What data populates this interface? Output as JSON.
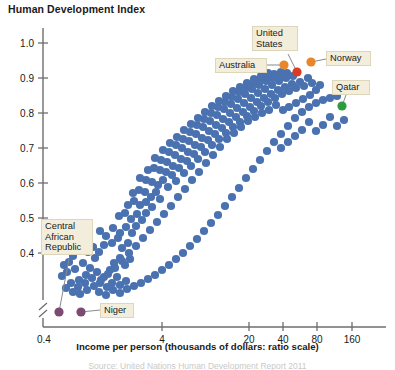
{
  "chart_title": "Human Development Index",
  "x_axis_title": "Income per person (thousands of dollars: ratio scale)",
  "source_note": "Source: United Nations Human Development Report 2011",
  "colors": {
    "point_default": "#4A72B0",
    "point_highlight_orange": "#E8862A",
    "point_highlight_red": "#D93B23",
    "point_highlight_green": "#2E9B40",
    "point_highlight_purple": "#7D4A72",
    "axis": "#6E6E6E",
    "callout_background": "#F3EEDC",
    "callout_border": "#DED6BA",
    "text": "#1A1A1A"
  },
  "chart_data": {
    "type": "scatter",
    "title": "Human Development Index",
    "xlabel": "Income per person (thousands of dollars: ratio scale)",
    "ylabel": "Human Development Index",
    "x_scale": "log",
    "x_scale_note": "ratio scale",
    "grid": false,
    "legend": "none",
    "axis_break_x": true,
    "axis_break_y": true,
    "xlim": [
      0.4,
      220
    ],
    "ylim": [
      0.33,
      1.03
    ],
    "x_ticks": [
      0.4,
      4,
      20,
      40,
      80,
      160
    ],
    "x_tick_labels": [
      "0.4",
      "4",
      "20",
      "40",
      "80",
      "160"
    ],
    "y_ticks": [
      0.4,
      0.5,
      0.6,
      0.7,
      0.8,
      0.9,
      1.0
    ],
    "y_tick_labels": [
      "0.4",
      "0.5",
      "0.6",
      "0.7",
      "0.8",
      "0.9",
      "1.0"
    ],
    "annotations": [
      {
        "label": "Australia",
        "x": 34.0,
        "y": 0.929,
        "color": "#E8862A"
      },
      {
        "label": "United States",
        "x": 43.0,
        "y": 0.91,
        "color": "#D93B23"
      },
      {
        "label": "Norway",
        "x": 57.0,
        "y": 0.943,
        "color": "#E8862A"
      },
      {
        "label": "Qatar",
        "x": 107.0,
        "y": 0.831,
        "color": "#2E9B40"
      },
      {
        "label": "Central African Republic",
        "x": 0.72,
        "y": 0.343,
        "color": "#7D4A72"
      },
      {
        "label": "Niger",
        "x": 1.05,
        "y": 0.343,
        "color": "#7D4A72"
      }
    ],
    "points": [
      {
        "px": 64,
        "py": 265
      },
      {
        "px": 69,
        "py": 262
      },
      {
        "px": 73,
        "py": 256
      },
      {
        "px": 67,
        "py": 272
      },
      {
        "px": 75,
        "py": 269
      },
      {
        "px": 62,
        "py": 276
      },
      {
        "px": 79,
        "py": 280
      },
      {
        "px": 86,
        "py": 275
      },
      {
        "px": 83,
        "py": 263
      },
      {
        "px": 90,
        "py": 268
      },
      {
        "px": 95,
        "py": 258
      },
      {
        "px": 88,
        "py": 252
      },
      {
        "px": 93,
        "py": 247
      },
      {
        "px": 99,
        "py": 252
      },
      {
        "px": 104,
        "py": 245
      },
      {
        "px": 97,
        "py": 272
      },
      {
        "px": 104,
        "py": 277
      },
      {
        "px": 110,
        "py": 270
      },
      {
        "px": 100,
        "py": 283
      },
      {
        "px": 107,
        "py": 287
      },
      {
        "px": 112,
        "py": 283
      },
      {
        "px": 117,
        "py": 277
      },
      {
        "px": 120,
        "py": 285
      },
      {
        "px": 126,
        "py": 281
      },
      {
        "px": 114,
        "py": 263
      },
      {
        "px": 120,
        "py": 258
      },
      {
        "px": 125,
        "py": 265
      },
      {
        "px": 130,
        "py": 259
      },
      {
        "px": 122,
        "py": 248
      },
      {
        "px": 128,
        "py": 243
      },
      {
        "px": 118,
        "py": 238
      },
      {
        "px": 112,
        "py": 243
      },
      {
        "px": 106,
        "py": 236
      },
      {
        "px": 100,
        "py": 231
      },
      {
        "px": 113,
        "py": 228
      },
      {
        "px": 120,
        "py": 233
      },
      {
        "px": 126,
        "py": 227
      },
      {
        "px": 132,
        "py": 233
      },
      {
        "px": 136,
        "py": 226
      },
      {
        "px": 131,
        "py": 219
      },
      {
        "px": 125,
        "py": 213
      },
      {
        "px": 119,
        "py": 216
      },
      {
        "px": 137,
        "py": 214
      },
      {
        "px": 142,
        "py": 220
      },
      {
        "px": 146,
        "py": 213
      },
      {
        "px": 140,
        "py": 205
      },
      {
        "px": 134,
        "py": 201
      },
      {
        "px": 128,
        "py": 205
      },
      {
        "px": 146,
        "py": 202
      },
      {
        "px": 152,
        "py": 207
      },
      {
        "px": 151,
        "py": 197
      },
      {
        "px": 145,
        "py": 192
      },
      {
        "px": 139,
        "py": 190
      },
      {
        "px": 133,
        "py": 193
      },
      {
        "px": 156,
        "py": 192
      },
      {
        "px": 160,
        "py": 199
      },
      {
        "px": 158,
        "py": 185
      },
      {
        "px": 152,
        "py": 182
      },
      {
        "px": 146,
        "py": 180
      },
      {
        "px": 140,
        "py": 178
      },
      {
        "px": 163,
        "py": 180
      },
      {
        "px": 168,
        "py": 187
      },
      {
        "px": 166,
        "py": 172
      },
      {
        "px": 160,
        "py": 170
      },
      {
        "px": 154,
        "py": 168
      },
      {
        "px": 148,
        "py": 170
      },
      {
        "px": 172,
        "py": 175
      },
      {
        "px": 176,
        "py": 181
      },
      {
        "px": 173,
        "py": 166
      },
      {
        "px": 167,
        "py": 162
      },
      {
        "px": 161,
        "py": 160
      },
      {
        "px": 155,
        "py": 158
      },
      {
        "px": 179,
        "py": 168
      },
      {
        "px": 184,
        "py": 173
      },
      {
        "px": 181,
        "py": 159
      },
      {
        "px": 175,
        "py": 155
      },
      {
        "px": 169,
        "py": 152
      },
      {
        "px": 163,
        "py": 150
      },
      {
        "px": 187,
        "py": 161
      },
      {
        "px": 191,
        "py": 166
      },
      {
        "px": 188,
        "py": 152
      },
      {
        "px": 182,
        "py": 148
      },
      {
        "px": 176,
        "py": 145
      },
      {
        "px": 170,
        "py": 143
      },
      {
        "px": 194,
        "py": 154
      },
      {
        "px": 198,
        "py": 159
      },
      {
        "px": 195,
        "py": 145
      },
      {
        "px": 189,
        "py": 141
      },
      {
        "px": 183,
        "py": 139
      },
      {
        "px": 177,
        "py": 137
      },
      {
        "px": 201,
        "py": 147
      },
      {
        "px": 205,
        "py": 152
      },
      {
        "px": 202,
        "py": 138
      },
      {
        "px": 196,
        "py": 134
      },
      {
        "px": 190,
        "py": 132
      },
      {
        "px": 184,
        "py": 130
      },
      {
        "px": 208,
        "py": 140
      },
      {
        "px": 212,
        "py": 145
      },
      {
        "px": 209,
        "py": 131
      },
      {
        "px": 203,
        "py": 127
      },
      {
        "px": 197,
        "py": 125
      },
      {
        "px": 191,
        "py": 124
      },
      {
        "px": 215,
        "py": 134
      },
      {
        "px": 219,
        "py": 139
      },
      {
        "px": 216,
        "py": 125
      },
      {
        "px": 210,
        "py": 121
      },
      {
        "px": 204,
        "py": 119
      },
      {
        "px": 198,
        "py": 118
      },
      {
        "px": 222,
        "py": 128
      },
      {
        "px": 226,
        "py": 133
      },
      {
        "px": 223,
        "py": 119
      },
      {
        "px": 217,
        "py": 115
      },
      {
        "px": 211,
        "py": 113
      },
      {
        "px": 205,
        "py": 112
      },
      {
        "px": 229,
        "py": 122
      },
      {
        "px": 233,
        "py": 127
      },
      {
        "px": 230,
        "py": 113
      },
      {
        "px": 224,
        "py": 109
      },
      {
        "px": 218,
        "py": 107
      },
      {
        "px": 212,
        "py": 106
      },
      {
        "px": 236,
        "py": 117
      },
      {
        "px": 240,
        "py": 122
      },
      {
        "px": 237,
        "py": 108
      },
      {
        "px": 231,
        "py": 104
      },
      {
        "px": 225,
        "py": 102
      },
      {
        "px": 219,
        "py": 101
      },
      {
        "px": 243,
        "py": 112
      },
      {
        "px": 247,
        "py": 116
      },
      {
        "px": 244,
        "py": 103
      },
      {
        "px": 238,
        "py": 99
      },
      {
        "px": 232,
        "py": 97
      },
      {
        "px": 226,
        "py": 96
      },
      {
        "px": 250,
        "py": 107
      },
      {
        "px": 254,
        "py": 111
      },
      {
        "px": 251,
        "py": 98
      },
      {
        "px": 245,
        "py": 94
      },
      {
        "px": 239,
        "py": 92
      },
      {
        "px": 233,
        "py": 91
      },
      {
        "px": 257,
        "py": 102
      },
      {
        "px": 261,
        "py": 106
      },
      {
        "px": 258,
        "py": 93
      },
      {
        "px": 252,
        "py": 89
      },
      {
        "px": 246,
        "py": 88
      },
      {
        "px": 240,
        "py": 87
      },
      {
        "px": 264,
        "py": 98
      },
      {
        "px": 268,
        "py": 102
      },
      {
        "px": 265,
        "py": 89
      },
      {
        "px": 259,
        "py": 85
      },
      {
        "px": 253,
        "py": 84
      },
      {
        "px": 247,
        "py": 83
      },
      {
        "px": 271,
        "py": 94
      },
      {
        "px": 275,
        "py": 98
      },
      {
        "px": 272,
        "py": 85
      },
      {
        "px": 266,
        "py": 81
      },
      {
        "px": 260,
        "py": 80
      },
      {
        "px": 254,
        "py": 79
      },
      {
        "px": 278,
        "py": 90
      },
      {
        "px": 282,
        "py": 94
      },
      {
        "px": 279,
        "py": 81
      },
      {
        "px": 273,
        "py": 78
      },
      {
        "px": 267,
        "py": 77
      },
      {
        "px": 261,
        "py": 76
      },
      {
        "px": 285,
        "py": 87
      },
      {
        "px": 289,
        "py": 91
      },
      {
        "px": 286,
        "py": 78
      },
      {
        "px": 280,
        "py": 75
      },
      {
        "px": 274,
        "py": 74
      },
      {
        "px": 268,
        "py": 73
      },
      {
        "px": 292,
        "py": 84
      },
      {
        "px": 296,
        "py": 88
      },
      {
        "px": 293,
        "py": 76
      },
      {
        "px": 287,
        "py": 73
      },
      {
        "px": 281,
        "py": 72
      },
      {
        "px": 300,
        "py": 82
      },
      {
        "px": 304,
        "py": 86
      },
      {
        "px": 308,
        "py": 78
      },
      {
        "px": 312,
        "py": 83
      },
      {
        "px": 316,
        "py": 90
      },
      {
        "px": 320,
        "py": 85
      },
      {
        "px": 310,
        "py": 95
      },
      {
        "px": 303,
        "py": 99
      },
      {
        "px": 296,
        "py": 103
      },
      {
        "px": 289,
        "py": 107
      },
      {
        "px": 283,
        "py": 110
      },
      {
        "px": 276,
        "py": 105
      },
      {
        "px": 269,
        "py": 110
      },
      {
        "px": 262,
        "py": 113
      },
      {
        "px": 255,
        "py": 117
      },
      {
        "px": 248,
        "py": 121
      },
      {
        "px": 241,
        "py": 127
      },
      {
        "px": 234,
        "py": 133
      },
      {
        "px": 227,
        "py": 139
      },
      {
        "px": 220,
        "py": 147
      },
      {
        "px": 213,
        "py": 155
      },
      {
        "px": 206,
        "py": 163
      },
      {
        "px": 199,
        "py": 172
      },
      {
        "px": 192,
        "py": 180
      },
      {
        "px": 185,
        "py": 189
      },
      {
        "px": 178,
        "py": 197
      },
      {
        "px": 171,
        "py": 206
      },
      {
        "px": 164,
        "py": 214
      },
      {
        "px": 157,
        "py": 222
      },
      {
        "px": 150,
        "py": 230
      },
      {
        "px": 143,
        "py": 238
      },
      {
        "px": 136,
        "py": 246
      },
      {
        "px": 129,
        "py": 253
      },
      {
        "px": 122,
        "py": 261
      },
      {
        "px": 115,
        "py": 268
      },
      {
        "px": 108,
        "py": 274
      },
      {
        "px": 101,
        "py": 280
      },
      {
        "px": 94,
        "py": 286
      },
      {
        "px": 87,
        "py": 290
      },
      {
        "px": 80,
        "py": 294
      },
      {
        "px": 73,
        "py": 292
      },
      {
        "px": 66,
        "py": 288
      },
      {
        "px": 71,
        "py": 283
      },
      {
        "px": 78,
        "py": 287
      },
      {
        "px": 85,
        "py": 283
      },
      {
        "px": 92,
        "py": 278
      },
      {
        "px": 99,
        "py": 292
      },
      {
        "px": 106,
        "py": 295
      },
      {
        "px": 113,
        "py": 290
      },
      {
        "px": 120,
        "py": 293
      },
      {
        "px": 127,
        "py": 289
      },
      {
        "px": 134,
        "py": 286
      },
      {
        "px": 141,
        "py": 283
      },
      {
        "px": 148,
        "py": 279
      },
      {
        "px": 155,
        "py": 275
      },
      {
        "px": 162,
        "py": 270
      },
      {
        "px": 169,
        "py": 265
      },
      {
        "px": 176,
        "py": 259
      },
      {
        "px": 183,
        "py": 253
      },
      {
        "px": 190,
        "py": 246
      },
      {
        "px": 197,
        "py": 239
      },
      {
        "px": 204,
        "py": 231
      },
      {
        "px": 211,
        "py": 223
      },
      {
        "px": 218,
        "py": 215
      },
      {
        "px": 225,
        "py": 206
      },
      {
        "px": 232,
        "py": 197
      },
      {
        "px": 239,
        "py": 188
      },
      {
        "px": 246,
        "py": 178
      },
      {
        "px": 253,
        "py": 169
      },
      {
        "px": 260,
        "py": 160
      },
      {
        "px": 267,
        "py": 151
      },
      {
        "px": 274,
        "py": 142
      },
      {
        "px": 281,
        "py": 134
      },
      {
        "px": 288,
        "py": 126
      },
      {
        "px": 295,
        "py": 118
      },
      {
        "px": 302,
        "py": 112
      },
      {
        "px": 309,
        "py": 107
      },
      {
        "px": 316,
        "py": 103
      },
      {
        "px": 323,
        "py": 100
      },
      {
        "px": 330,
        "py": 98
      },
      {
        "px": 337,
        "py": 96
      },
      {
        "px": 344,
        "py": 120
      },
      {
        "px": 337,
        "py": 126
      },
      {
        "px": 330,
        "py": 117
      },
      {
        "px": 323,
        "py": 125
      },
      {
        "px": 316,
        "py": 131
      },
      {
        "px": 309,
        "py": 122
      },
      {
        "px": 302,
        "py": 130
      },
      {
        "px": 295,
        "py": 136
      },
      {
        "px": 288,
        "py": 142
      },
      {
        "px": 281,
        "py": 148
      }
    ]
  },
  "y_tick_positions_px": [
    {
      "label": "1.0",
      "py": 43
    },
    {
      "label": "0.9",
      "py": 78
    },
    {
      "label": "0.8",
      "py": 113
    },
    {
      "label": "0.7",
      "py": 148
    },
    {
      "label": "0.6",
      "py": 183
    },
    {
      "label": "0.5",
      "py": 218
    },
    {
      "label": "0.4",
      "py": 253
    }
  ],
  "x_tick_positions_px": [
    {
      "label": "0.4",
      "px": 43
    },
    {
      "label": "4",
      "px": 162
    },
    {
      "label": "20",
      "px": 249
    },
    {
      "label": "40",
      "px": 283
    },
    {
      "label": "80",
      "px": 317
    },
    {
      "label": "160",
      "px": 352
    }
  ],
  "callouts": [
    {
      "name": "australia",
      "text": "Australia",
      "left": 215,
      "top": 58,
      "width": 52,
      "height": 15,
      "anchor_x": 284,
      "anchor_y": 65,
      "line_from_x": 267,
      "line_from_y": 65
    },
    {
      "name": "united-states",
      "text": "United States",
      "left": 252,
      "top": 26,
      "width": 46,
      "height": 28,
      "anchor_x": 297,
      "anchor_y": 72,
      "line_from_x": 288,
      "line_from_y": 54,
      "multiline": true
    },
    {
      "name": "norway",
      "text": "Norway",
      "left": 326,
      "top": 51,
      "width": 45,
      "height": 15,
      "anchor_x": 311,
      "anchor_y": 62,
      "line_from_x": 326,
      "line_from_y": 59
    },
    {
      "name": "qatar",
      "text": "Qatar",
      "left": 332,
      "top": 80,
      "width": 38,
      "height": 15,
      "anchor_x": 342,
      "anchor_y": 106,
      "line_from_x": 346,
      "line_from_y": 95
    },
    {
      "name": "central-african-republic",
      "text": "Central African Republic",
      "left": 41,
      "top": 219,
      "width": 52,
      "height": 40,
      "anchor_x": 59,
      "anchor_y": 312,
      "line_from_x": 69,
      "line_from_y": 259,
      "multiline": true
    },
    {
      "name": "niger",
      "text": "Niger",
      "left": 100,
      "top": 303,
      "width": 34,
      "height": 15,
      "anchor_x": 81,
      "anchor_y": 312,
      "line_from_x": 100,
      "line_from_y": 310
    }
  ]
}
